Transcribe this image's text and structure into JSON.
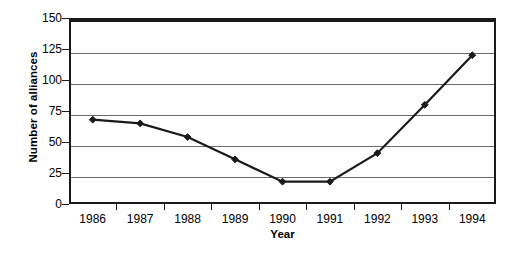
{
  "chart_data": {
    "type": "line",
    "title": "",
    "subtitle": "",
    "xlabel": "Year",
    "ylabel": "Number of alliances",
    "categories": [
      "1986",
      "1987",
      "1988",
      "1989",
      "1990",
      "1991",
      "1992",
      "1993",
      "1994"
    ],
    "x": [
      1986,
      1987,
      1988,
      1989,
      1990,
      1991,
      1992,
      1993,
      1994
    ],
    "values": [
      68,
      65,
      54,
      36,
      18,
      18,
      41,
      80,
      120
    ],
    "series": [
      {
        "name": "Number of alliances",
        "values": [
          68,
          65,
          54,
          36,
          18,
          18,
          41,
          80,
          120
        ]
      }
    ],
    "ylim": [
      0,
      150
    ],
    "yticks": [
      0,
      25,
      50,
      75,
      100,
      125,
      150
    ],
    "ytick_labels": [
      "0",
      "25",
      "50",
      "75",
      "100",
      "125",
      "150"
    ],
    "grid": true,
    "grid_axis": "y",
    "legend": false,
    "legend_position": "none",
    "marker": "diamond",
    "line_color": "#1a1a1a",
    "marker_color": "#1a1a1a",
    "grid_color": "#6b6b6b",
    "axis_color": "#1a1a1a",
    "background_color": "#ffffff",
    "annotations": []
  }
}
